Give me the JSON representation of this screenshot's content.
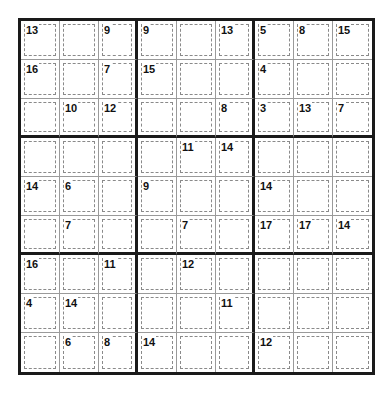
{
  "puzzle": {
    "type": "killer-sudoku",
    "size": 9,
    "clues": [
      {
        "row": 0,
        "col": 0,
        "sum": "13"
      },
      {
        "row": 0,
        "col": 2,
        "sum": "9"
      },
      {
        "row": 0,
        "col": 3,
        "sum": "9"
      },
      {
        "row": 0,
        "col": 5,
        "sum": "13"
      },
      {
        "row": 0,
        "col": 6,
        "sum": "5"
      },
      {
        "row": 0,
        "col": 7,
        "sum": "8"
      },
      {
        "row": 0,
        "col": 8,
        "sum": "15"
      },
      {
        "row": 1,
        "col": 0,
        "sum": "16"
      },
      {
        "row": 1,
        "col": 2,
        "sum": "7"
      },
      {
        "row": 1,
        "col": 3,
        "sum": "15"
      },
      {
        "row": 1,
        "col": 6,
        "sum": "4"
      },
      {
        "row": 2,
        "col": 1,
        "sum": "10"
      },
      {
        "row": 2,
        "col": 2,
        "sum": "12"
      },
      {
        "row": 2,
        "col": 5,
        "sum": "8"
      },
      {
        "row": 2,
        "col": 6,
        "sum": "3"
      },
      {
        "row": 2,
        "col": 7,
        "sum": "13"
      },
      {
        "row": 2,
        "col": 8,
        "sum": "7"
      },
      {
        "row": 3,
        "col": 4,
        "sum": "11"
      },
      {
        "row": 3,
        "col": 5,
        "sum": "14"
      },
      {
        "row": 4,
        "col": 0,
        "sum": "14"
      },
      {
        "row": 4,
        "col": 1,
        "sum": "6"
      },
      {
        "row": 4,
        "col": 3,
        "sum": "9"
      },
      {
        "row": 4,
        "col": 6,
        "sum": "14"
      },
      {
        "row": 5,
        "col": 1,
        "sum": "7"
      },
      {
        "row": 5,
        "col": 4,
        "sum": "7"
      },
      {
        "row": 5,
        "col": 6,
        "sum": "17"
      },
      {
        "row": 5,
        "col": 7,
        "sum": "17"
      },
      {
        "row": 5,
        "col": 8,
        "sum": "14"
      },
      {
        "row": 6,
        "col": 0,
        "sum": "16"
      },
      {
        "row": 6,
        "col": 2,
        "sum": "11"
      },
      {
        "row": 6,
        "col": 4,
        "sum": "12"
      },
      {
        "row": 7,
        "col": 0,
        "sum": "4"
      },
      {
        "row": 7,
        "col": 1,
        "sum": "14"
      },
      {
        "row": 7,
        "col": 5,
        "sum": "11"
      },
      {
        "row": 8,
        "col": 1,
        "sum": "6"
      },
      {
        "row": 8,
        "col": 2,
        "sum": "8"
      },
      {
        "row": 8,
        "col": 3,
        "sum": "14"
      },
      {
        "row": 8,
        "col": 6,
        "sum": "12"
      }
    ],
    "values": [
      [
        "",
        "",
        "",
        "",
        "",
        "",
        "",
        "",
        ""
      ],
      [
        "",
        "",
        "",
        "",
        "",
        "",
        "",
        "",
        ""
      ],
      [
        "",
        "",
        "",
        "",
        "",
        "",
        "",
        "",
        ""
      ],
      [
        "",
        "",
        "",
        "",
        "",
        "",
        "",
        "",
        ""
      ],
      [
        "",
        "",
        "",
        "",
        "",
        "",
        "",
        "",
        ""
      ],
      [
        "",
        "",
        "",
        "",
        "",
        "",
        "",
        "",
        ""
      ],
      [
        "",
        "",
        "",
        "",
        "",
        "",
        "",
        "",
        ""
      ],
      [
        "",
        "",
        "",
        "",
        "",
        "",
        "",
        "",
        ""
      ],
      [
        "",
        "",
        "",
        "",
        "",
        "",
        "",
        "",
        ""
      ]
    ]
  },
  "colors": {
    "box_border": "#1a1a1a",
    "cell_border": "#9a9a9a",
    "cage_border": "#8a8a8a",
    "clue_text": "#111111",
    "background": "#ffffff"
  }
}
